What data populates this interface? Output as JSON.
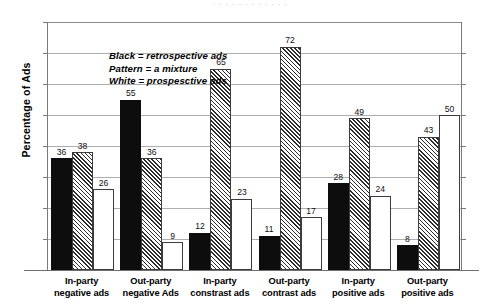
{
  "figure": {
    "title_sliver": "· · · · · · · · · · · ·",
    "ylabel": "Percentage of Ads",
    "legend": [
      "Black = retrospective ads",
      "Pattern = a mixture",
      "White = prospesctive ads"
    ]
  },
  "chart_data": {
    "type": "bar",
    "title": "",
    "xlabel": "",
    "ylabel": "Percentage of Ads",
    "ylim": [
      0,
      80
    ],
    "ytick_step": 10,
    "yticks": [
      0,
      10,
      20,
      30,
      40,
      50,
      60,
      70,
      80
    ],
    "grid": true,
    "legend_position": "inside-top-left",
    "categories": [
      "In-party negative ads",
      "Out-party negative Ads",
      "In-party constrast ads",
      "Out-party contrast ads",
      "In-party positive ads",
      "Out-party positive ads"
    ],
    "category_lines": [
      [
        "In-party",
        "negative ads"
      ],
      [
        "Out-party",
        "negative Ads"
      ],
      [
        "In-party",
        "constrast ads"
      ],
      [
        "Out-party",
        "contrast ads"
      ],
      [
        "In-party",
        "positive ads"
      ],
      [
        "Out-party",
        "positive ads"
      ]
    ],
    "series": [
      {
        "name": "Black = retrospective ads",
        "fill": "black",
        "values": [
          36,
          55,
          12,
          11,
          28,
          8
        ]
      },
      {
        "name": "Pattern = a mixture",
        "fill": "pattern",
        "values": [
          38,
          36,
          65,
          72,
          49,
          43
        ]
      },
      {
        "name": "White = prospesctive ads",
        "fill": "white",
        "values": [
          26,
          9,
          23,
          17,
          24,
          50
        ]
      }
    ]
  },
  "colors": {
    "black_bar": "#0d0d0d",
    "bar_outline": "#3c3c3c",
    "gridline": "#aeaeae",
    "axis": "#7a7a7a",
    "background": "#ffffff"
  }
}
